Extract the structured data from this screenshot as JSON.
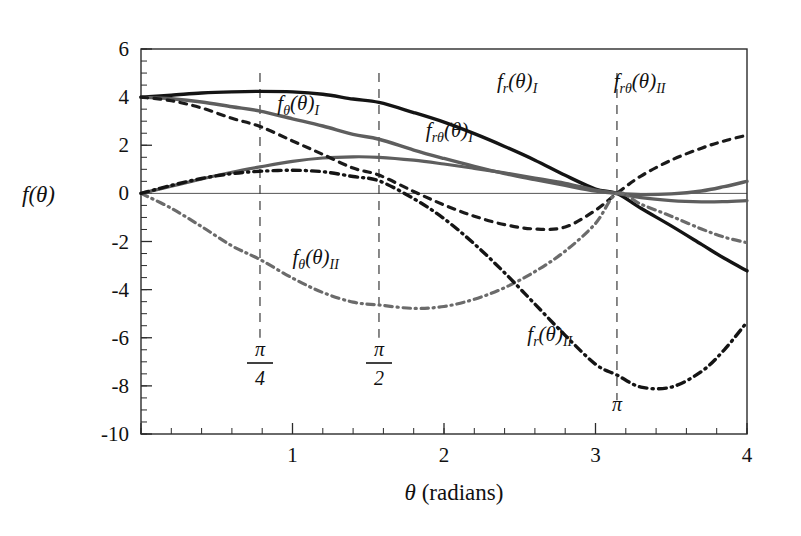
{
  "chart_data": {
    "type": "line",
    "title": "",
    "xlabel": "θ  (radians)",
    "ylabel": "f(θ)",
    "xlim": [
      0,
      4
    ],
    "ylim": [
      -10,
      6
    ],
    "xticks": [
      0,
      1,
      2,
      3,
      4
    ],
    "xticklabels": [
      "",
      "1",
      "2",
      "3",
      "4"
    ],
    "yticks": [
      6,
      4,
      2,
      0,
      -2,
      -4,
      -6,
      -8,
      -10
    ],
    "yticklabels": [
      "6",
      "4",
      "2",
      "0",
      "-2",
      "-4",
      "-6",
      "-8",
      "-10"
    ],
    "x_minor_step": 0.2,
    "y_minor_step": 0.5,
    "grid": false,
    "legend_position": "inline-annotations",
    "annotations": [
      {
        "name": "pi-over-4",
        "text_num": "π",
        "text_den": "4",
        "x": 0.7854
      },
      {
        "name": "pi-over-2",
        "text_num": "π",
        "text_den": "2",
        "x": 1.5708
      },
      {
        "name": "pi",
        "text_num": "π",
        "text_den": "",
        "x": 3.1416
      }
    ],
    "vertical_guides": [
      0.7854,
      1.5708,
      3.1416
    ],
    "x": [
      0,
      0.2,
      0.4,
      0.6,
      0.7854,
      1.0,
      1.2,
      1.4,
      1.5708,
      1.8,
      2.0,
      2.2,
      2.4,
      2.6,
      2.8,
      3.0,
      3.1416,
      3.3,
      3.5,
      3.7,
      3.85,
      4.0
    ],
    "series": [
      {
        "name": "f_r(θ)_I",
        "label_main": "f",
        "label_sub": "r",
        "label_arg": "(θ)",
        "label_roman": "I",
        "color": "#141414",
        "style": "solid",
        "width": 3.4,
        "label_x": 2.35,
        "label_y": 4.4,
        "values": [
          4.0,
          4.08,
          4.17,
          4.22,
          4.24,
          4.22,
          4.12,
          3.92,
          3.78,
          3.36,
          2.96,
          2.48,
          1.95,
          1.38,
          0.75,
          0.18,
          0.0,
          -0.62,
          -1.35,
          -2.12,
          -2.7,
          -3.22
        ]
      },
      {
        "name": "f_θ(θ)_I",
        "label_main": "f",
        "label_sub": "θ",
        "label_arg": "(θ)",
        "label_roman": "I",
        "color": "#5e5e5e",
        "style": "solid",
        "width": 3.4,
        "label_x": 0.9,
        "label_y": 3.45,
        "values": [
          4.0,
          3.93,
          3.8,
          3.6,
          3.42,
          3.1,
          2.8,
          2.45,
          2.25,
          1.8,
          1.45,
          1.12,
          0.82,
          0.57,
          0.33,
          0.1,
          0.0,
          -0.05,
          -0.02,
          0.1,
          0.28,
          0.5
        ]
      },
      {
        "name": "f_rθ(θ)_I",
        "label_main": "f",
        "label_sub": "rθ",
        "label_arg": "(θ)",
        "label_roman": "I",
        "color": "#5e5e5e",
        "style": "solid",
        "width": 3.2,
        "label_x": 1.88,
        "label_y": 2.35,
        "values": [
          0.0,
          0.3,
          0.6,
          0.88,
          1.1,
          1.33,
          1.47,
          1.52,
          1.5,
          1.38,
          1.22,
          1.04,
          0.85,
          0.64,
          0.42,
          0.14,
          0.0,
          -0.18,
          -0.3,
          -0.35,
          -0.34,
          -0.3
        ]
      },
      {
        "name": "f_rθ(θ)_II",
        "label_main": "f",
        "label_sub": "rθ",
        "label_arg": "(θ)",
        "label_roman": "II",
        "color": "#1a1a1a",
        "style": "dashed",
        "width": 3.2,
        "label_x": 3.12,
        "label_y": 4.4,
        "values": [
          4.0,
          3.85,
          3.55,
          3.12,
          2.78,
          2.18,
          1.62,
          1.05,
          0.76,
          0.08,
          -0.48,
          -0.95,
          -1.3,
          -1.48,
          -1.4,
          -0.7,
          0.0,
          0.72,
          1.38,
          1.88,
          2.18,
          2.42
        ]
      },
      {
        "name": "f_θ(θ)_II",
        "label_main": "f",
        "label_sub": "θ",
        "label_arg": "(θ)",
        "label_roman": "II",
        "color": "#6b6b6b",
        "style": "dashdot",
        "width": 3.2,
        "label_x": 1.0,
        "label_y": -2.95,
        "values": [
          0.0,
          -0.62,
          -1.38,
          -2.18,
          -2.75,
          -3.52,
          -4.12,
          -4.52,
          -4.64,
          -4.78,
          -4.7,
          -4.4,
          -3.92,
          -3.25,
          -2.4,
          -1.25,
          0.0,
          -0.45,
          -0.95,
          -1.48,
          -1.82,
          -2.05
        ]
      },
      {
        "name": "f_r(θ)_II",
        "label_main": "f",
        "label_sub": "r",
        "label_arg": "(θ)",
        "label_roman": "II",
        "color": "#141414",
        "style": "dashdot",
        "width": 3.4,
        "label_x": 2.55,
        "label_y": -6.15,
        "values": [
          0.0,
          0.33,
          0.62,
          0.82,
          0.92,
          0.96,
          0.9,
          0.7,
          0.52,
          -0.22,
          -1.05,
          -2.1,
          -3.3,
          -4.6,
          -5.9,
          -7.1,
          -7.55,
          -8.05,
          -8.05,
          -7.4,
          -6.5,
          -5.35
        ]
      }
    ]
  }
}
